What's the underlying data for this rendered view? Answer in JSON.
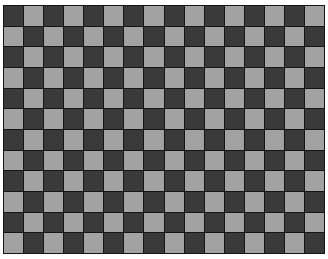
{
  "image": {
    "description": "Grayscale checkerboard calibration pattern",
    "board": {
      "columns": 16,
      "rows": 12,
      "top_left_cell": "dark",
      "colors": {
        "dark": "#3a3a3a",
        "light": "#a2a2a2",
        "grid_line": "#151515",
        "background": "#ffffff"
      }
    }
  }
}
